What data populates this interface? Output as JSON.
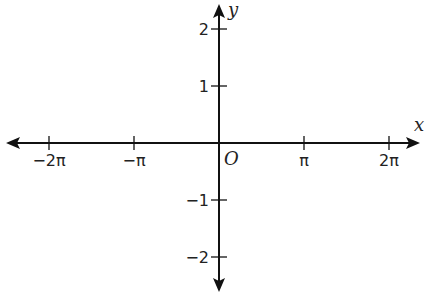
{
  "chart_data": {
    "type": "line",
    "title": "",
    "xlabel": "x",
    "ylabel": "y",
    "origin_label": "O",
    "xlim": [
      -6.5,
      6.9
    ],
    "ylim": [
      -2.5,
      2.5
    ],
    "grid": false,
    "x_ticks": [
      {
        "value": -6.2832,
        "label": "−2π"
      },
      {
        "value": -3.1416,
        "label": "−π"
      },
      {
        "value": 3.1416,
        "label": "π"
      },
      {
        "value": 6.2832,
        "label": "2π"
      }
    ],
    "y_ticks": [
      {
        "value": 2,
        "label": "2"
      },
      {
        "value": 1,
        "label": "1"
      },
      {
        "value": -1,
        "label": "−1"
      },
      {
        "value": -2,
        "label": "−2"
      }
    ],
    "series": [
      {
        "name": "y = sin x",
        "color": "#555555",
        "function": "sin(x)",
        "x_range": [
          -6.2832,
          6.2832
        ]
      },
      {
        "name": "straight line",
        "color": "#aaaaaa",
        "function": "0.2*x - 1",
        "x_range": [
          -6.2832,
          6.2832
        ],
        "points": [
          [
            -6.2832,
            -2.26
          ],
          [
            0,
            -1
          ],
          [
            6.2832,
            0.26
          ]
        ]
      }
    ]
  }
}
